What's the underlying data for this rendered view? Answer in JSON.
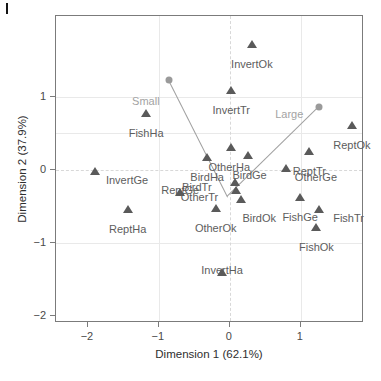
{
  "chart_data": {
    "type": "scatter",
    "title": "",
    "subtitle": "",
    "xlabel": "Dimension 1 (62.1%)",
    "ylabel": "Dimension 2 (37.9%)",
    "xlim": [
      -2.45,
      1.89
    ],
    "ylim": [
      -2.1,
      2.11
    ],
    "xticks": [
      -2,
      -1,
      0,
      1
    ],
    "xticklabels": [
      "−2",
      "−1",
      "0",
      "1"
    ],
    "yticks": [
      1,
      0,
      -1,
      -2
    ],
    "yticklabels": [
      "1",
      "0",
      "−1",
      "−2"
    ],
    "grid": "light dashed at x=0 and y=0, faint solid at x=-1,1 and y=1,-1,0.5",
    "legend": "none",
    "marker_color": "#5a5a5a",
    "supplementary_color": "#9a9a9a",
    "series": [
      {
        "name": "categories",
        "marker": "triangle",
        "color": "#5a5a5a",
        "points": [
          {
            "label": "InvertOk",
            "x": 0.31,
            "y": 1.73,
            "label_dx": 0,
            "label_dy": 15
          },
          {
            "label": "InvertTr",
            "x": 0.02,
            "y": 1.09,
            "label_dx": 0,
            "label_dy": 15
          },
          {
            "label": "FishHa",
            "x": -1.18,
            "y": 0.78,
            "label_dx": 0,
            "label_dy": 15
          },
          {
            "label": "ReptOk",
            "x": 1.72,
            "y": 0.61,
            "label_dx": 0,
            "label_dy": 15
          },
          {
            "label": "OtherHa",
            "x": 0.02,
            "y": 0.31,
            "label_dx": -2,
            "label_dy": 15
          },
          {
            "label": "BirdHa",
            "x": -0.32,
            "y": 0.17,
            "label_dx": 0,
            "label_dy": 15
          },
          {
            "label": "BirdGe",
            "x": 0.25,
            "y": 0.2,
            "label_dx": 2,
            "label_dy": 15
          },
          {
            "label": "ReptTr",
            "x": 1.12,
            "y": 0.26,
            "label_dx": 0,
            "label_dy": 15
          },
          {
            "label": "OtherGe",
            "x": 0.79,
            "y": 0.02,
            "label_dx": 30,
            "label_dy": 4
          },
          {
            "label": "InvertGe",
            "x": -1.9,
            "y": -0.02,
            "label_dx": 32,
            "label_dy": 4
          },
          {
            "label": "ReptGe",
            "x": -0.7,
            "y": -0.3,
            "label_dx": 0,
            "label_dy": -7
          },
          {
            "label": "BirdTr",
            "x": 0.07,
            "y": -0.17,
            "label_dx": -38,
            "label_dy": 0
          },
          {
            "label": "OtherTr",
            "x": 0.08,
            "y": -0.28,
            "label_dx": -36,
            "label_dy": 2
          },
          {
            "label": "BirdOk",
            "x": 0.16,
            "y": -0.4,
            "label_dx": 18,
            "label_dy": 14
          },
          {
            "label": "FishGe",
            "x": 0.99,
            "y": -0.37,
            "label_dx": 0,
            "label_dy": 15
          },
          {
            "label": "FishTr",
            "x": 1.25,
            "y": -0.53,
            "label_dx": 30,
            "label_dy": 4
          },
          {
            "label": "ReptHa",
            "x": -1.44,
            "y": -0.54,
            "label_dx": 0,
            "label_dy": 15
          },
          {
            "label": "OtherOk",
            "x": -0.2,
            "y": -0.52,
            "label_dx": 0,
            "label_dy": 15
          },
          {
            "label": "FishOk",
            "x": 1.22,
            "y": -0.78,
            "label_dx": 0,
            "label_dy": 15
          },
          {
            "label": "InvertHa",
            "x": -0.11,
            "y": -1.4,
            "label_dx": 0,
            "label_dy": -7
          }
        ]
      },
      {
        "name": "supplementary",
        "marker": "circle",
        "color": "#9a9a9a",
        "points": [
          {
            "label": "Small",
            "x": -0.86,
            "y": 1.23,
            "label_dx": -23,
            "label_dy": 16
          },
          {
            "label": "Large",
            "x": 1.26,
            "y": 0.86,
            "label_dx": -30,
            "label_dy": 2
          }
        ]
      }
    ],
    "connectors": [
      {
        "from": "Small",
        "to_x": -0.03,
        "to_y": -0.37
      },
      {
        "from": "Large",
        "to_x": -0.03,
        "to_y": -0.37
      }
    ]
  }
}
